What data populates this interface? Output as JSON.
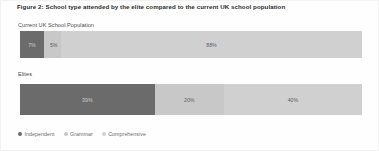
{
  "chart_data": {
    "type": "bar",
    "orientation": "horizontal",
    "stacked": true,
    "normalized_percent": true,
    "title": "Figure 2: School type attended by the elite compared to the current UK school population",
    "xlabel": "",
    "ylabel": "",
    "xlim": [
      0,
      100
    ],
    "grid": false,
    "legend_position": "bottom-left",
    "categories": [
      "Current UK School Population",
      "Elites"
    ],
    "series": [
      {
        "name": "Independent",
        "color": "#6b6b6b",
        "values": [
          7,
          39
        ],
        "labels": [
          "7%",
          "39%"
        ]
      },
      {
        "name": "Grammar",
        "color": "#c8c8c8",
        "values": [
          5,
          20
        ],
        "labels": [
          "5%",
          "20%"
        ]
      },
      {
        "name": "Comprehensive",
        "color": "#d0d0d0",
        "values": [
          88,
          40
        ],
        "labels": [
          "88%",
          "40%"
        ]
      }
    ]
  },
  "title": {
    "text": "Figure 2: School type attended by the elite compared to the current UK school population"
  },
  "groups": [
    {
      "label": "Current UK School Population",
      "segments": [
        {
          "series": "Independent",
          "label": "7%",
          "value": 7,
          "color": "#6b6b6b"
        },
        {
          "series": "Grammar",
          "label": "5%",
          "value": 5,
          "color": "#c8c8c8"
        },
        {
          "series": "Comprehensive",
          "label": "88%",
          "value": 88,
          "color": "#d0d0d0"
        }
      ]
    },
    {
      "label": "Elites",
      "segments": [
        {
          "series": "Independent",
          "label": "39%",
          "value": 39,
          "color": "#6b6b6b"
        },
        {
          "series": "Grammar",
          "label": "20%",
          "value": 20,
          "color": "#c8c8c8"
        },
        {
          "series": "Comprehensive",
          "label": "40%",
          "value": 40,
          "color": "#d0d0d0"
        }
      ]
    }
  ],
  "legend": {
    "items": [
      {
        "label": "Independent",
        "color": "#6b6b6b"
      },
      {
        "label": "Grammar",
        "color": "#c8c8c8"
      },
      {
        "label": "Comprehensive",
        "color": "#d0d0d0"
      }
    ]
  },
  "colors": {
    "independent": "#6b6b6b",
    "grammar": "#c8c8c8",
    "comprehensive": "#d0d0d0",
    "background": "#fefefe",
    "title_text": "#2b2b2b",
    "group_label_text": "#4a4a4a",
    "legend_text": "#6d6d6d"
  }
}
